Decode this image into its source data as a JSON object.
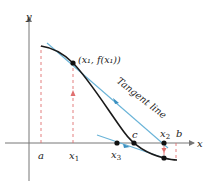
{
  "figure": {
    "axes": {
      "x_label": "x",
      "y_label": "y",
      "axis_color": "#777777"
    },
    "labels": {
      "a": "a",
      "b": "b",
      "c": "c",
      "x1": "x",
      "x1_sub": "1",
      "x2": "x",
      "x2_sub": "2",
      "x3": "x",
      "x3_sub": "3",
      "point": "(x₁, f(x₁))",
      "tangent": "Tangent line"
    },
    "colors": {
      "curve": "#1a1a1a",
      "tangent": "#6ab4d8",
      "tangent_arrow": "#3a8fc0",
      "dashed": "#e07070",
      "point": "#111111"
    }
  }
}
